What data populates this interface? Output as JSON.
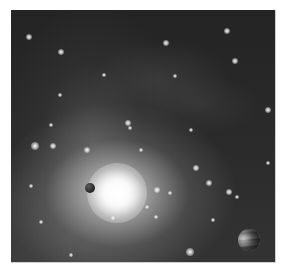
{
  "image": {
    "subject": "space scene: nebula with bright star, small dark planet and banded gas giant",
    "palette": {
      "background": "#ffffff",
      "space": "#1e1e1e",
      "glow": "#ffffff",
      "nebula": "#8a8a8a"
    },
    "frame": {
      "x": 11,
      "y": 10,
      "width": 264,
      "height": 252
    },
    "sun": {
      "cx": 106,
      "cy": 183,
      "size": 60
    },
    "planets": [
      {
        "name": "small-rocky-planet",
        "cx": 79,
        "cy": 178,
        "r": 5
      },
      {
        "name": "banded-gas-giant",
        "cx": 238,
        "cy": 230,
        "r": 11
      }
    ],
    "stars": [
      {
        "x": 18,
        "y": 27,
        "s": 3
      },
      {
        "x": 50,
        "y": 42,
        "s": 3
      },
      {
        "x": 155,
        "y": 33,
        "s": 3
      },
      {
        "x": 216,
        "y": 21,
        "s": 3
      },
      {
        "x": 224,
        "y": 51,
        "s": 3
      },
      {
        "x": 164,
        "y": 66,
        "s": 2
      },
      {
        "x": 40,
        "y": 115,
        "s": 2
      },
      {
        "x": 24,
        "y": 136,
        "s": 4
      },
      {
        "x": 42,
        "y": 136,
        "s": 3
      },
      {
        "x": 117,
        "y": 113,
        "s": 3
      },
      {
        "x": 119,
        "y": 118,
        "s": 2
      },
      {
        "x": 76,
        "y": 140,
        "s": 3
      },
      {
        "x": 146,
        "y": 180,
        "s": 3
      },
      {
        "x": 159,
        "y": 183,
        "s": 2
      },
      {
        "x": 185,
        "y": 158,
        "s": 3
      },
      {
        "x": 198,
        "y": 173,
        "s": 3
      },
      {
        "x": 218,
        "y": 182,
        "s": 3
      },
      {
        "x": 226,
        "y": 187,
        "s": 2
      },
      {
        "x": 202,
        "y": 210,
        "s": 2
      },
      {
        "x": 179,
        "y": 242,
        "s": 4
      },
      {
        "x": 102,
        "y": 208,
        "s": 2
      },
      {
        "x": 145,
        "y": 207,
        "s": 2
      },
      {
        "x": 136,
        "y": 197,
        "s": 2
      },
      {
        "x": 257,
        "y": 100,
        "s": 3
      },
      {
        "x": 257,
        "y": 153,
        "s": 2
      },
      {
        "x": 49,
        "y": 85,
        "s": 2
      },
      {
        "x": 93,
        "y": 65,
        "s": 2
      },
      {
        "x": 180,
        "y": 120,
        "s": 2
      },
      {
        "x": 20,
        "y": 176,
        "s": 2
      },
      {
        "x": 30,
        "y": 212,
        "s": 2
      },
      {
        "x": 130,
        "y": 140,
        "s": 2
      },
      {
        "x": 60,
        "y": 245,
        "s": 2
      }
    ]
  }
}
